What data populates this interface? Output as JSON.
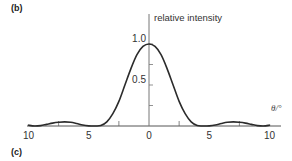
{
  "panels": {
    "current_label": "(b)",
    "next_label": "(c)"
  },
  "chart_data": {
    "type": "line",
    "title": "",
    "xlabel": "θ/°",
    "ylabel": "relative intensity",
    "xlim": [
      -10,
      10
    ],
    "ylim": [
      0,
      1.0
    ],
    "x_tick_labels": [
      "10",
      "5",
      "0",
      "5",
      "10"
    ],
    "x_ticks": [
      -10,
      -5,
      0,
      5,
      10
    ],
    "x_minor_ticks": [
      -7.5,
      -2.5,
      2.5,
      7.5
    ],
    "y_tick_labels": [
      "1.0",
      "0.5"
    ],
    "y_ticks": [
      1.0,
      0.5
    ],
    "y_minor_ticks": [
      0.25,
      0.75
    ],
    "grid": false,
    "legend": null,
    "series": [
      {
        "name": "diffraction intensity (sinc² pattern)",
        "x": [
          -10,
          -9.5,
          -9,
          -8.5,
          -8,
          -7.5,
          -7,
          -6.5,
          -6,
          -5.5,
          -5,
          -4.5,
          -4,
          -3.5,
          -3,
          -2.5,
          -2,
          -1.5,
          -1,
          -0.5,
          0,
          0.5,
          1,
          1.5,
          2,
          2.5,
          3,
          3.5,
          4,
          4.5,
          5,
          5.5,
          6,
          6.5,
          7,
          7.5,
          8,
          8.5,
          9,
          9.5,
          10
        ],
        "values": [
          0.01,
          0.0,
          0.005,
          0.02,
          0.035,
          0.045,
          0.05,
          0.045,
          0.03,
          0.012,
          0.002,
          0.0,
          0.005,
          0.05,
          0.15,
          0.3,
          0.5,
          0.7,
          0.87,
          0.97,
          1.0,
          0.97,
          0.87,
          0.7,
          0.5,
          0.3,
          0.15,
          0.05,
          0.005,
          0.0,
          0.002,
          0.012,
          0.03,
          0.045,
          0.05,
          0.045,
          0.035,
          0.02,
          0.005,
          0.0,
          0.01
        ]
      }
    ]
  }
}
